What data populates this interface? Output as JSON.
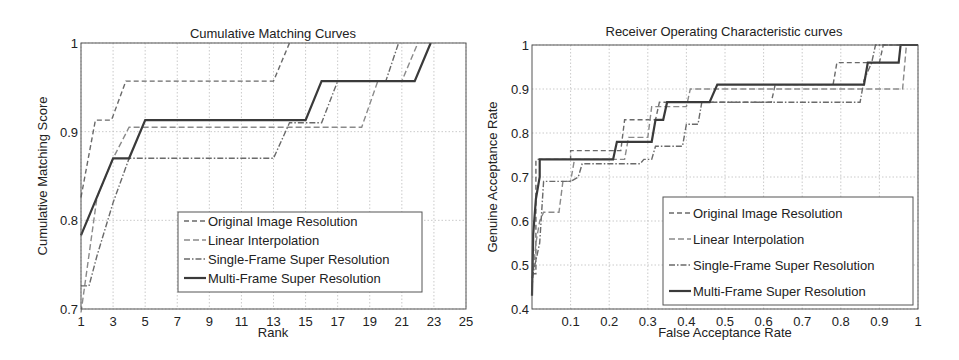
{
  "chart_data": [
    {
      "type": "line",
      "title": "Cumulative Matching Curves",
      "xlabel": "Rank",
      "ylabel": "Cumulative Matching Score",
      "xlim": [
        1,
        25
      ],
      "ylim": [
        0.7,
        1.0
      ],
      "xticks": [
        "1",
        "3",
        "5",
        "7",
        "9",
        "11",
        "13",
        "15",
        "17",
        "19",
        "21",
        "23",
        "25"
      ],
      "yticks": [
        "0.7",
        "0.8",
        "0.9",
        "1"
      ],
      "grid": true,
      "legend_position": "lower center",
      "series": [
        {
          "name": "Original Image Resolution",
          "style": "dashed",
          "x": [
            1,
            1.9,
            2.9,
            3.8,
            13,
            14
          ],
          "y": [
            0.826,
            0.913,
            0.913,
            0.957,
            0.957,
            1.0
          ]
        },
        {
          "name": "Linear Interpolation",
          "style": "dashed",
          "x": [
            1,
            2,
            3,
            4,
            18.5,
            19.5,
            21,
            22
          ],
          "y": [
            0.696,
            0.826,
            0.87,
            0.905,
            0.905,
            0.957,
            0.957,
            1.0
          ]
        },
        {
          "name": "Single-Frame Super Resolution",
          "style": "dashdot",
          "x": [
            1,
            1.5,
            2,
            3,
            4,
            13,
            14,
            16,
            17,
            20,
            20.8
          ],
          "y": [
            0.726,
            0.726,
            0.76,
            0.82,
            0.87,
            0.87,
            0.91,
            0.91,
            0.957,
            0.957,
            1.0
          ]
        },
        {
          "name": "Multi-Frame Super Resolution",
          "style": "solid",
          "x": [
            1,
            3,
            4,
            5,
            15,
            16,
            21.8,
            22.8
          ],
          "y": [
            0.783,
            0.87,
            0.87,
            0.913,
            0.913,
            0.957,
            0.957,
            1.0
          ]
        }
      ]
    },
    {
      "type": "line",
      "title": "Receiver Operating Characteristic curves",
      "xlabel": "False Acceptance Rate",
      "ylabel": "Genuine Acceptance Rate",
      "xlim": [
        0,
        1
      ],
      "ylim": [
        0.4,
        1.0
      ],
      "xticks": [
        "0.1",
        "0.2",
        "0.3",
        "0.4",
        "0.5",
        "0.6",
        "0.7",
        "0.8",
        "0.9",
        "1"
      ],
      "yticks": [
        "0.4",
        "0.5",
        "0.6",
        "0.7",
        "0.8",
        "0.9",
        "1"
      ],
      "grid": true,
      "legend_position": "lower right",
      "series": [
        {
          "name": "Original Image Resolution",
          "style": "dashed",
          "x": [
            0,
            0.01,
            0.01,
            0.1,
            0.1,
            0.23,
            0.24,
            0.32,
            0.33,
            0.41,
            0.42,
            0.62,
            0.63,
            0.78,
            0.79,
            0.9,
            0.91,
            1.0
          ],
          "y": [
            0.48,
            0.48,
            0.74,
            0.74,
            0.76,
            0.76,
            0.83,
            0.83,
            0.87,
            0.87,
            0.87,
            0.87,
            0.91,
            0.91,
            0.96,
            0.96,
            1.0,
            1.0
          ]
        },
        {
          "name": "Linear Interpolation",
          "style": "dashed",
          "x": [
            0,
            0.01,
            0.02,
            0.03,
            0.07,
            0.08,
            0.1,
            0.11,
            0.24,
            0.25,
            0.3,
            0.31,
            0.4,
            0.41,
            0.96,
            0.97,
            1.0
          ],
          "y": [
            0.45,
            0.55,
            0.6,
            0.62,
            0.62,
            0.69,
            0.69,
            0.74,
            0.74,
            0.79,
            0.79,
            0.86,
            0.86,
            0.9,
            0.9,
            1.0,
            1.0
          ]
        },
        {
          "name": "Single-Frame Super Resolution",
          "style": "dashdot",
          "x": [
            0,
            0.02,
            0.03,
            0.1,
            0.12,
            0.13,
            0.28,
            0.29,
            0.31,
            0.32,
            0.39,
            0.4,
            0.43,
            0.44,
            0.85,
            0.86,
            0.88,
            0.89,
            1.0
          ],
          "y": [
            0.47,
            0.55,
            0.69,
            0.69,
            0.7,
            0.73,
            0.73,
            0.74,
            0.74,
            0.77,
            0.77,
            0.82,
            0.82,
            0.87,
            0.87,
            0.92,
            0.96,
            1.0,
            1.0
          ]
        },
        {
          "name": "Multi-Frame Super Resolution",
          "style": "solid",
          "x": [
            0,
            0.003,
            0.01,
            0.02,
            0.02,
            0.21,
            0.22,
            0.31,
            0.32,
            0.34,
            0.35,
            0.46,
            0.48,
            0.86,
            0.87,
            0.95,
            0.955,
            1.0
          ],
          "y": [
            0.43,
            0.57,
            0.65,
            0.7,
            0.74,
            0.74,
            0.78,
            0.78,
            0.83,
            0.83,
            0.87,
            0.87,
            0.91,
            0.91,
            0.96,
            0.96,
            1.0,
            1.0
          ]
        }
      ]
    }
  ],
  "legend": {
    "entries": [
      "Original Image Resolution",
      "Linear Interpolation",
      "Single-Frame Super Resolution",
      "Multi-Frame Super Resolution"
    ]
  }
}
